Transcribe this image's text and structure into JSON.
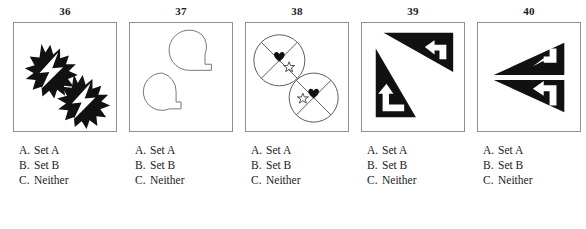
{
  "page": {
    "background_color": "#ffffff",
    "ink_color": "#1a1a1a",
    "box_border_color": "#8f8f8f",
    "figure_fill_color": "#111111"
  },
  "options_common": [
    {
      "letter": "A.",
      "text": "Set A"
    },
    {
      "letter": "B.",
      "text": "Set B"
    },
    {
      "letter": "C.",
      "text": "Neither"
    }
  ],
  "items": [
    {
      "number": "36",
      "figure_name": "two-spiky-burst-shapes-with-white-lightning-bolts",
      "figure_description": "Two black starburst/explosion shapes arranged diagonally from upper-left to lower-right, each containing a white lightning bolt",
      "options": [
        {
          "letter": "A.",
          "text": "Set A"
        },
        {
          "letter": "B.",
          "text": "Set B"
        },
        {
          "letter": "C.",
          "text": "Neither"
        }
      ]
    },
    {
      "number": "37",
      "figure_name": "two-outlined-circles-with-square-tails",
      "figure_description": "Two white circles outlined in gray, each with a small square tail at the lower right, resembling the letter Q",
      "options": [
        {
          "letter": "A.",
          "text": "Set A"
        },
        {
          "letter": "B.",
          "text": "Set B"
        },
        {
          "letter": "C.",
          "text": "Neither"
        }
      ]
    },
    {
      "number": "38",
      "figure_name": "two-crossed-circles-with-heart-and-star",
      "figure_description": "Two outlined circles each divided by an X cross, with a filled black heart in the top wedge and an outlined star in a side wedge",
      "options": [
        {
          "letter": "A.",
          "text": "Set A"
        },
        {
          "letter": "B.",
          "text": "Set B"
        },
        {
          "letter": "C.",
          "text": "Neither"
        }
      ]
    },
    {
      "number": "39",
      "figure_name": "two-black-triangles-with-white-bent-arrows",
      "figure_description": "An upper-right black triangle containing a white left-pointing bent arrow and a lower-left black triangle containing a white up-pointing bent arrow",
      "options": [
        {
          "letter": "A.",
          "text": "Set A"
        },
        {
          "letter": "B.",
          "text": "Set B"
        },
        {
          "letter": "C.",
          "text": "Neither"
        }
      ]
    },
    {
      "number": "40",
      "figure_name": "two-mirrored-left-triangles-with-white-bent-arrows",
      "figure_description": "Two black triangles pointing left, mirrored across a horizontal axis, each containing a white left-pointing bent arrow",
      "options": [
        {
          "letter": "A.",
          "text": "Set A"
        },
        {
          "letter": "B.",
          "text": "Set B"
        },
        {
          "letter": "C.",
          "text": "Neither"
        }
      ]
    }
  ]
}
